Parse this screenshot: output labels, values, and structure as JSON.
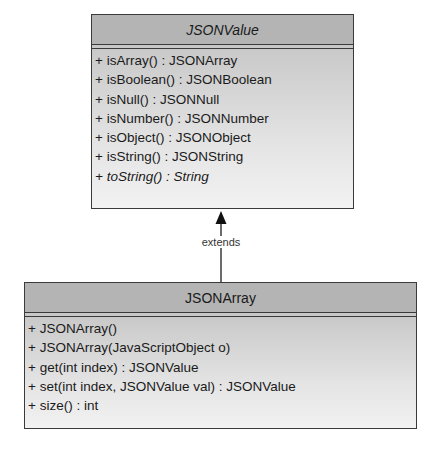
{
  "diagram": {
    "type": "uml-class",
    "classes": [
      {
        "name": "JSONValue",
        "abstract": true,
        "methods": [
          {
            "text": "+ isArray() : JSONArray",
            "italic": false
          },
          {
            "text": "+ isBoolean() : JSONBoolean",
            "italic": false
          },
          {
            "text": "+ isNull() : JSONNull",
            "italic": false
          },
          {
            "text": "+ isNumber() : JSONNumber",
            "italic": false
          },
          {
            "text": "+ isObject() : JSONObject",
            "italic": false
          },
          {
            "text": "+ isString() : JSONString",
            "italic": false
          },
          {
            "text": "+ toString() : String",
            "italic": true
          }
        ]
      },
      {
        "name": "JSONArray",
        "abstract": false,
        "methods": [
          {
            "text": "+ JSONArray()",
            "italic": false
          },
          {
            "text": "+ JSONArray(JavaScriptObject o)",
            "italic": false
          },
          {
            "text": "+ get(int index) : JSONValue",
            "italic": false
          },
          {
            "text": "+ set(int index, JSONValue val) : JSONValue",
            "italic": false
          },
          {
            "text": "+ size() : int",
            "italic": false
          }
        ]
      }
    ],
    "relationships": [
      {
        "from": "JSONArray",
        "to": "JSONValue",
        "label": "extends",
        "type": "generalization"
      }
    ],
    "colors": {
      "header": "#b4b4b4",
      "border": "#3a3a3a",
      "body_top": "#c9c9c9",
      "body_bottom": "#f2f2f2"
    }
  }
}
